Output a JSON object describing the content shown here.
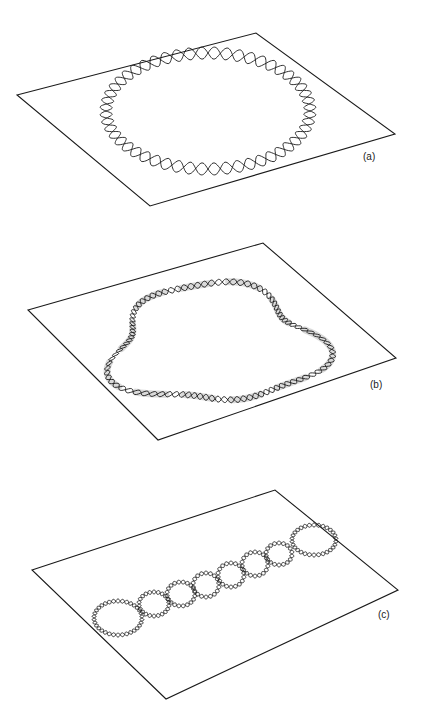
{
  "figure": {
    "panels": [
      {
        "id": "a",
        "label": "(a)",
        "caption_hint": "relaxed circular double helix with ring of loops",
        "plane": [
          [
            17,
            95
          ],
          [
            256,
            33
          ],
          [
            395,
            134
          ],
          [
            150,
            206
          ]
        ],
        "loop": {
          "cx": 208,
          "cy": 111,
          "rx": 102,
          "ry": 58,
          "waves": 26,
          "amp": 6
        }
      },
      {
        "id": "b",
        "label": "(b)",
        "caption_hint": "circular DNA with bound protein regions (shaded)",
        "plane": [
          [
            28,
            310
          ],
          [
            263,
            243
          ],
          [
            396,
            358
          ],
          [
            158,
            440
          ]
        ],
        "loop": {
          "cx": 215,
          "cy": 345,
          "rx": 102,
          "ry": 58,
          "waves": 48,
          "amp": 3
        }
      },
      {
        "id": "c",
        "label": "(c)",
        "caption_hint": "supercoiled / condensed chain of beaded loops",
        "plane": [
          [
            32,
            570
          ],
          [
            275,
            490
          ],
          [
            398,
            590
          ],
          [
            166,
            699
          ]
        ],
        "beads": [
          {
            "cx": 118,
            "cy": 618,
            "rx": 24,
            "ry": 17
          },
          {
            "cx": 154,
            "cy": 604,
            "rx": 15,
            "ry": 12
          },
          {
            "cx": 181,
            "cy": 594,
            "rx": 14,
            "ry": 12
          },
          {
            "cx": 206,
            "cy": 585,
            "rx": 13,
            "ry": 12
          },
          {
            "cx": 231,
            "cy": 575,
            "rx": 13,
            "ry": 12
          },
          {
            "cx": 255,
            "cy": 564,
            "rx": 13,
            "ry": 12
          },
          {
            "cx": 279,
            "cy": 554,
            "rx": 13,
            "ry": 11
          },
          {
            "cx": 314,
            "cy": 540,
            "rx": 22,
            "ry": 15
          }
        ]
      }
    ]
  }
}
